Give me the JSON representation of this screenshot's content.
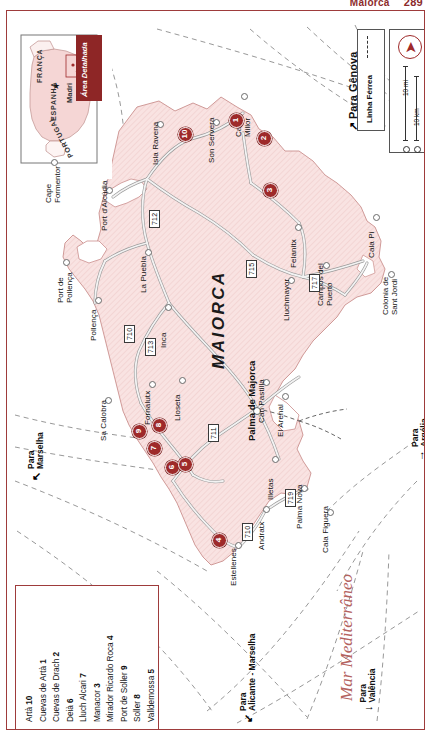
{
  "page_header": {
    "title": "Maiorca",
    "page_number": "289"
  },
  "inset": {
    "labels": [
      "FRANÇA",
      "ESPANHA",
      "PORTUGAL"
    ],
    "capital": "Madri",
    "capital_marker": "star-icon",
    "detail_box_label": "Área Detalhada"
  },
  "legend": {
    "railway_label": "Linha Férrea",
    "railway_symbol": "dashed-line-icon",
    "north_symbol": "north-arrow-icon",
    "scale_miles": "10 mi",
    "scale_km": "10 km"
  },
  "island": {
    "name": "MAIORCA",
    "sea_name": "Mar Mediterrâneo"
  },
  "towns": [
    {
      "name": "Cala Millor",
      "x": 236,
      "y": 84,
      "two_line": true
    },
    {
      "name": "Son Servera",
      "x": 208,
      "y": 110,
      "two_line": false
    },
    {
      "name": "Isla Ravena",
      "x": 152,
      "y": 112,
      "two_line": false
    },
    {
      "name": "Port d'Alcúdia",
      "x": 101,
      "y": 178,
      "two_line": false
    },
    {
      "name": "La Puebla",
      "x": 140,
      "y": 240,
      "two_line": false
    },
    {
      "name": "Cape Formentor",
      "x": 46,
      "y": 150,
      "two_line": true
    },
    {
      "name": "Port de Pollença",
      "x": 58,
      "y": 250,
      "two_line": true
    },
    {
      "name": "Pollença",
      "x": 90,
      "y": 288,
      "two_line": false
    },
    {
      "name": "Inca",
      "x": 160,
      "y": 295,
      "two_line": false
    },
    {
      "name": "Sa Calobra",
      "x": 100,
      "y": 388,
      "two_line": false
    },
    {
      "name": "Fornalutx",
      "x": 144,
      "y": 372,
      "two_line": false
    },
    {
      "name": "Lloseta",
      "x": 174,
      "y": 368,
      "two_line": false
    },
    {
      "name": "Felanitx",
      "x": 290,
      "y": 215,
      "two_line": false
    },
    {
      "name": "Lluchmayor",
      "x": 283,
      "y": 268,
      "two_line": false
    },
    {
      "name": "Campos del Puerto",
      "x": 318,
      "y": 253,
      "two_line": true
    },
    {
      "name": "Cala Pi",
      "x": 368,
      "y": 205,
      "two_line": false
    },
    {
      "name": "Colonia de Sant Jordi",
      "x": 383,
      "y": 262,
      "two_line": true
    },
    {
      "name": "Can Pastilla",
      "x": 258,
      "y": 370,
      "two_line": false
    },
    {
      "name": "El Arenal",
      "x": 277,
      "y": 384,
      "two_line": false
    },
    {
      "name": "Illetas",
      "x": 267,
      "y": 447,
      "two_line": false
    },
    {
      "name": "Palma Nova",
      "x": 296,
      "y": 476,
      "two_line": false
    },
    {
      "name": "Cala Figuera",
      "x": 322,
      "y": 500,
      "two_line": false
    },
    {
      "name": "Andratx",
      "x": 258,
      "y": 497,
      "two_line": false
    },
    {
      "name": "Estellenes",
      "x": 230,
      "y": 533,
      "two_line": false
    }
  ],
  "capital_city": {
    "name": "Palma de Majorca",
    "x": 248,
    "y": 398
  },
  "roads": [
    {
      "number": "712",
      "x": 147,
      "y": 208
    },
    {
      "number": "715",
      "x": 244,
      "y": 258
    },
    {
      "number": "717",
      "x": 307,
      "y": 272
    },
    {
      "number": "710",
      "x": 122,
      "y": 323
    },
    {
      "number": "713",
      "x": 143,
      "y": 336
    },
    {
      "number": "711",
      "x": 206,
      "y": 422
    },
    {
      "number": "719",
      "x": 283,
      "y": 487
    },
    {
      "number": "710",
      "x": 240,
      "y": 521
    }
  ],
  "poi_markers": [
    {
      "id": "1",
      "x": 228,
      "y": 108
    },
    {
      "id": "2",
      "x": 256,
      "y": 126
    },
    {
      "id": "3",
      "x": 262,
      "y": 178
    },
    {
      "id": "10",
      "x": 177,
      "y": 122
    },
    {
      "id": "9",
      "x": 131,
      "y": 419
    },
    {
      "id": "8",
      "x": 151,
      "y": 413
    },
    {
      "id": "7",
      "x": 146,
      "y": 436
    },
    {
      "id": "6",
      "x": 164,
      "y": 455
    },
    {
      "id": "5",
      "x": 177,
      "y": 452
    },
    {
      "id": "4",
      "x": 211,
      "y": 528
    }
  ],
  "poi_index": [
    {
      "name": "Artà",
      "num": "10"
    },
    {
      "name": "Cuevas de Artà",
      "num": "1"
    },
    {
      "name": "Cuevas de Drach",
      "num": "2"
    },
    {
      "name": "Deià",
      "num": "6"
    },
    {
      "name": "Lluch Alcari",
      "num": "7"
    },
    {
      "name": "Manacor",
      "num": "3"
    },
    {
      "name": "Mirador Ricardo Roca",
      "num": "4"
    },
    {
      "name": "Port de Soller",
      "num": "9"
    },
    {
      "name": "Soller",
      "num": "8"
    },
    {
      "name": "Valldemossa",
      "num": "5"
    }
  ],
  "directions": [
    {
      "label": "Para Gênova",
      "x": 340,
      "y": 120,
      "arrow": "↗",
      "size": "big"
    },
    {
      "label": "Para Marselha",
      "x": 20,
      "y": 470,
      "arrow": "↖",
      "size": "small"
    },
    {
      "label": "Para Argélia",
      "x": 404,
      "y": 450,
      "arrow": "→",
      "size": "small"
    },
    {
      "label": "Para Valência",
      "x": 352,
      "y": 700,
      "arrow": "↓",
      "size": "small"
    },
    {
      "label": "Para Alicante - Marselha",
      "x": 232,
      "y": 712,
      "arrow": "↙",
      "size": "small"
    }
  ],
  "colors": {
    "land": "#f7dedd",
    "land_stroke": "#d8a8a6",
    "frame": "#9e3b3b",
    "marker": "#9e2a2a",
    "sea_text": "#b4635f",
    "road": "#e8e8e8",
    "road_edge": "#9a9a9a"
  }
}
